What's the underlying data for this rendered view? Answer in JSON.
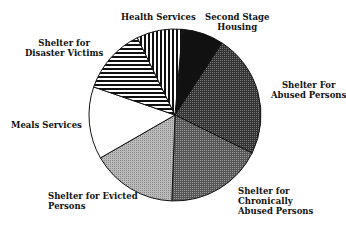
{
  "chart_data": {
    "type": "pie",
    "title": "",
    "categories": [
      "Second Stage Housing",
      "Shelter For Abused Persons",
      "Shelter for Chronically Abused Persons",
      "Shelter for Evicted Persons",
      "Meals Services",
      "Shelter for Disaster Victims",
      "Health Services"
    ],
    "values": [
      7.8,
      23.1,
      18.3,
      16.1,
      13.6,
      12.5,
      8.6
    ],
    "unit": "percent (estimated)",
    "start_angle_deg": 5,
    "fills": [
      "solid-black",
      "dark-dots",
      "dark-gray-dots",
      "light-gray-dots",
      "white",
      "horizontal-stripes",
      "vertical-stripes"
    ],
    "legend": "none (direct labels)"
  },
  "labels": {
    "second_stage_1": "Second Stage",
    "second_stage_2": "Housing",
    "abused_1": "Shelter For",
    "abused_2": "Abused Persons",
    "chronic_1": "Shelter for",
    "chronic_2": "Chronically",
    "chronic_3": "Abused Persons",
    "evicted_1": "Shelter for Evicted",
    "evicted_2": "Persons",
    "meals": "Meals Services",
    "disaster_1": "Shelter for",
    "disaster_2": "Disaster Victims",
    "health": "Health Services"
  }
}
